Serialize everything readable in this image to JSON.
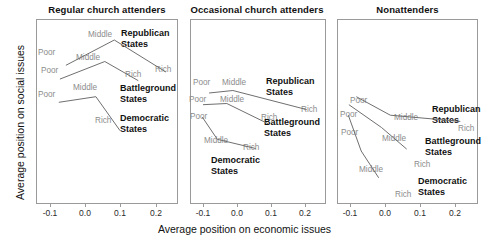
{
  "chart_data": {
    "type": "line",
    "title": "",
    "xlabel": "Average position on economic issues",
    "ylabel": "Average position on social issues",
    "xlim": [
      -0.135,
      0.265
    ],
    "ylim": [
      -0.3,
      0.3
    ],
    "xticks": [
      -0.1,
      0.0,
      0.1,
      0.2
    ],
    "xticklabels": [
      "-0.1",
      "0.0",
      "0.1",
      "0.2"
    ],
    "grid": false,
    "legend": "inline-annotations",
    "panels": [
      {
        "title": "Regular church attenders",
        "series": [
          {
            "name": "Republican States",
            "point_labels": [
              "Poor",
              "Middle",
              "Rich"
            ],
            "x": [
              -0.055,
              0.082,
              0.228
            ],
            "y": [
              0.15,
              0.232,
              0.128
            ]
          },
          {
            "name": "Battleground States",
            "point_labels": [
              "Poor",
              "Middle",
              "Rich"
            ],
            "x": [
              -0.072,
              0.055,
              0.15
            ],
            "y": [
              0.105,
              0.162,
              0.1
            ]
          },
          {
            "name": "Democratic States",
            "point_labels": [
              "Poor",
              "Middle",
              "Rich"
            ],
            "x": [
              -0.075,
              0.03,
              0.098
            ],
            "y": [
              0.03,
              0.048,
              -0.062
            ]
          }
        ]
      },
      {
        "title": "Occasional church attenders",
        "series": [
          {
            "name": "Republican States",
            "point_labels": [
              "Poor",
              "Middle",
              "Rich"
            ],
            "x": [
              -0.082,
              -0.012,
              0.205
            ],
            "y": [
              0.06,
              0.068,
              0.006
            ]
          },
          {
            "name": "Battleground States",
            "point_labels": [
              "Poor",
              "Middle",
              "Rich"
            ],
            "x": [
              -0.1,
              -0.03,
              0.092
            ],
            "y": [
              0.022,
              0.026,
              -0.04
            ]
          },
          {
            "name": "Democratic States",
            "point_labels": [
              "Poor",
              "Middle",
              "Rich"
            ],
            "x": [
              -0.102,
              -0.058,
              0.055
            ],
            "y": [
              -0.018,
              -0.09,
              -0.12
            ]
          }
        ]
      },
      {
        "title": "Nonattenders",
        "series": [
          {
            "name": "Republican States",
            "point_labels": [
              "Poor",
              "Middle",
              "Rich"
            ],
            "x": [
              -0.082,
              0.015,
              0.215
            ],
            "y": [
              0.048,
              -0.012,
              -0.032
            ]
          },
          {
            "name": "Battleground States",
            "point_labels": [
              "Poor",
              "Middle",
              "Rich"
            ],
            "x": [
              -0.103,
              -0.01,
              0.062
            ],
            "y": [
              0.022,
              -0.052,
              -0.122
            ]
          },
          {
            "name": "Democratic States",
            "point_labels": [
              "Poor",
              "Middle",
              "Rich"
            ],
            "x": [
              -0.105,
              -0.068,
              -0.018
            ],
            "y": [
              -0.012,
              -0.128,
              -0.215
            ]
          }
        ]
      }
    ]
  },
  "axes": {
    "xlabel": "Average position on economic issues",
    "ylabel": "Average position on social issues",
    "ticklabels": [
      "-0.1",
      "0.0",
      "0.1",
      "0.2"
    ]
  },
  "panel1": {
    "title": "Regular church attenders",
    "rep": {
      "name_line1": "Republican",
      "name_line2": "States",
      "poor": "Poor",
      "middle": "Middle",
      "rich": "Rich"
    },
    "bat": {
      "name_line1": "Battleground",
      "name_line2": "States",
      "poor": "Poor",
      "middle": "Middle",
      "rich": "Rich"
    },
    "dem": {
      "name_line1": "Democratic",
      "name_line2": "States",
      "poor": "Poor",
      "middle": "Middle",
      "rich": "Rich"
    }
  },
  "panel2": {
    "title": "Occasional church attenders",
    "rep": {
      "name_line1": "Republican",
      "name_line2": "States",
      "poor": "Poor",
      "middle": "Middle",
      "rich": "Rich"
    },
    "bat": {
      "name_line1": "Battleground",
      "name_line2": "States",
      "poor": "Poor",
      "middle": "Middle",
      "rich": "Rich"
    },
    "dem": {
      "name_line1": "Democratic",
      "name_line2": "States",
      "poor": "Poor",
      "middle": "Middle",
      "rich": "Rich"
    }
  },
  "panel3": {
    "title": "Nonattenders",
    "rep": {
      "name_line1": "Republican",
      "name_line2": "States",
      "poor": "Poor",
      "middle": "Middle",
      "rich": "Rich"
    },
    "bat": {
      "name_line1": "Battleground",
      "name_line2": "States",
      "poor": "Poor",
      "middle": "Middle",
      "rich": "Rich"
    },
    "dem": {
      "name_line1": "Democratic",
      "name_line2": "States",
      "poor": "Poor",
      "middle": "Middle",
      "rich": "Rich"
    }
  }
}
